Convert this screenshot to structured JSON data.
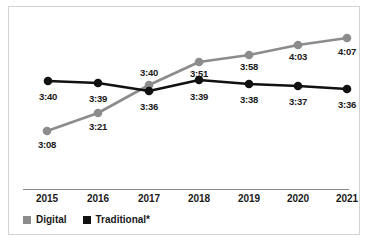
{
  "chart_data": {
    "type": "line",
    "title": "",
    "xlabel": "",
    "ylabel": "",
    "grid": false,
    "legend_position": "bottom-left",
    "categories": [
      "2015",
      "2016",
      "2017",
      "2018",
      "2019",
      "2020",
      "2021"
    ],
    "series": [
      {
        "name": "Digital",
        "color": "#8c8c8c",
        "labels": [
          "3:08",
          "3:21",
          "3:40",
          "3:51",
          "3:58",
          "4:03",
          "4:07"
        ],
        "values": [
          188,
          201,
          220,
          231,
          238,
          243,
          247
        ],
        "value_unit": "minutes",
        "points": [
          {
            "x": 38,
            "y": 124,
            "label": "3:08",
            "label_x": 38,
            "label_y": 133
          },
          {
            "x": 89,
            "y": 106,
            "label": "3:21",
            "label_x": 89,
            "label_y": 115
          },
          {
            "x": 140,
            "y": 78,
            "label": "3:40",
            "label_x": 140,
            "label_y": 61
          },
          {
            "x": 190,
            "y": 55,
            "label": "3:51",
            "label_x": 190,
            "label_y": 62
          },
          {
            "x": 240,
            "y": 48,
            "label": "3:58",
            "label_x": 240,
            "label_y": 55
          },
          {
            "x": 289,
            "y": 38,
            "label": "4:03",
            "label_x": 289,
            "label_y": 45
          },
          {
            "x": 338,
            "y": 31,
            "label": "4:07",
            "label_x": 338,
            "label_y": 40
          }
        ]
      },
      {
        "name": "Traditional*",
        "color": "#111111",
        "labels": [
          "3:40",
          "3:39",
          "3:36",
          "3:39",
          "3:38",
          "3:37",
          "3:36"
        ],
        "values": [
          220,
          219,
          216,
          219,
          218,
          217,
          216
        ],
        "value_unit": "minutes",
        "points": [
          {
            "x": 39,
            "y": 74,
            "label": "3:40",
            "label_x": 39,
            "label_y": 85
          },
          {
            "x": 89,
            "y": 76,
            "label": "3:39",
            "label_x": 89,
            "label_y": 87
          },
          {
            "x": 140,
            "y": 84,
            "label": "3:36",
            "label_x": 140,
            "label_y": 95
          },
          {
            "x": 190,
            "y": 73,
            "label": "3:39",
            "label_x": 190,
            "label_y": 85
          },
          {
            "x": 240,
            "y": 77,
            "label": "3:38",
            "label_x": 240,
            "label_y": 88
          },
          {
            "x": 289,
            "y": 79,
            "label": "3:37",
            "label_x": 289,
            "label_y": 90
          },
          {
            "x": 338,
            "y": 82,
            "label": "3:36",
            "label_x": 338,
            "label_y": 93
          }
        ]
      }
    ],
    "x_tick_positions": [
      38,
      89,
      140,
      190,
      240,
      289,
      338
    ]
  },
  "legend": {
    "items": [
      {
        "label": "Digital",
        "color": "#8c8c8c"
      },
      {
        "label": "Traditional*",
        "color": "#111111"
      }
    ]
  }
}
